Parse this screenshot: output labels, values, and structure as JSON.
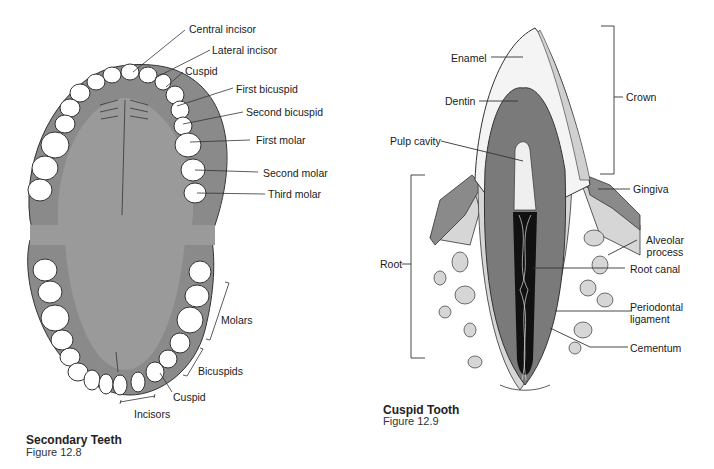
{
  "figures": [
    {
      "id": "secondary-teeth",
      "title": "Secondary Teeth",
      "figure_number": "Figure 12.8",
      "upper_labels": [
        "Central incisor",
        "Lateral incisor",
        "Cuspid",
        "First bicuspid",
        "Second bicuspid",
        "First molar",
        "Second molar",
        "Third molar"
      ],
      "lower_labels": {
        "molars": "Molars",
        "bicuspids": "Bicuspids",
        "cuspid": "Cuspid",
        "incisors": "Incisors"
      }
    },
    {
      "id": "cuspid-tooth",
      "title": "Cuspid Tooth",
      "figure_number": "Figure 12.9",
      "labels": {
        "enamel": "Enamel",
        "dentin": "Dentin",
        "pulp_cavity": "Pulp cavity",
        "crown": "Crown",
        "gingiva": "Gingiva",
        "root": "Root",
        "alveolar_process_1": "Alveolar",
        "alveolar_process_2": "process",
        "root_canal": "Root canal",
        "periodontal_1": "Periodontal",
        "periodontal_2": "ligament",
        "cementum": "Cementum"
      }
    }
  ],
  "colors": {
    "gum": "#8a8a8a",
    "palate": "#9a9a9a",
    "tooth": "#ffffff",
    "bone": "#d6d6d6",
    "dentin": "#7a7a7a",
    "canal": "#111111"
  }
}
